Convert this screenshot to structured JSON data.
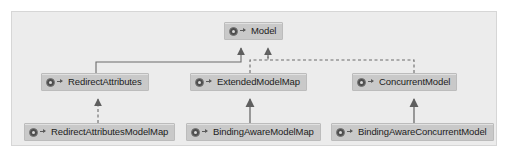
{
  "diagram": {
    "kind": "uml-class-diagram",
    "canvas_color": "#ececec",
    "node_color": "#c9c9c9",
    "line_color": "#6b6b6b",
    "nodes": [
      {
        "id": "model",
        "label": "Model",
        "icon": "class-icon",
        "visibility": "public"
      },
      {
        "id": "redirect-attributes",
        "label": "RedirectAttributes",
        "icon": "class-icon",
        "visibility": "public"
      },
      {
        "id": "extended-model-map",
        "label": "ExtendedModelMap",
        "icon": "class-icon",
        "visibility": "public"
      },
      {
        "id": "concurrent-model",
        "label": "ConcurrentModel",
        "icon": "class-icon",
        "visibility": "public"
      },
      {
        "id": "redirect-attributes-model-map",
        "label": "RedirectAttributesModelMap",
        "icon": "class-icon",
        "visibility": "public"
      },
      {
        "id": "binding-aware-model-map",
        "label": "BindingAwareModelMap",
        "icon": "class-icon",
        "visibility": "public"
      },
      {
        "id": "binding-aware-concurrent-model",
        "label": "BindingAwareConcurrentModel",
        "icon": "class-icon",
        "visibility": "public"
      }
    ],
    "edges": [
      {
        "from": "redirect-attributes",
        "to": "model",
        "style": "solid",
        "arrow": "triangle"
      },
      {
        "from": "extended-model-map",
        "to": "model",
        "style": "dashed",
        "arrow": "triangle"
      },
      {
        "from": "concurrent-model",
        "to": "model",
        "style": "dashed",
        "arrow": "triangle"
      },
      {
        "from": "redirect-attributes-model-map",
        "to": "redirect-attributes",
        "style": "dashed",
        "arrow": "triangle"
      },
      {
        "from": "binding-aware-model-map",
        "to": "extended-model-map",
        "style": "solid",
        "arrow": "triangle"
      },
      {
        "from": "binding-aware-concurrent-model",
        "to": "concurrent-model",
        "style": "solid",
        "arrow": "triangle"
      }
    ]
  }
}
